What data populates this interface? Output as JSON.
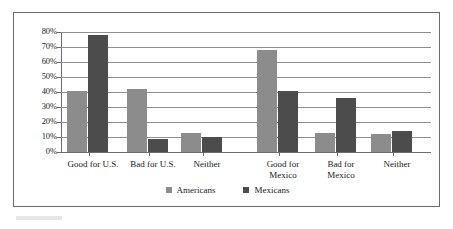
{
  "chart_data": {
    "type": "bar",
    "title": "",
    "xlabel": "",
    "ylabel": "",
    "ylim": [
      0,
      80
    ],
    "grid": true,
    "legend_position": "bottom-center",
    "categories": [
      "Good for U.S.",
      "Bad for U.S.",
      "Neither",
      "Good for\nMexico",
      "Bad for\nMexico",
      "Neither"
    ],
    "series": [
      {
        "name": "Americans",
        "color": "#8c8c8c",
        "values": [
          41,
          42,
          13,
          68,
          13,
          12
        ]
      },
      {
        "name": "Mexicans",
        "color": "#4c4c4c",
        "values": [
          78,
          9,
          10,
          41,
          36,
          14
        ]
      }
    ],
    "ytick_labels": [
      "80%",
      "70%",
      "60%",
      "50%",
      "40%",
      "30%",
      "20%",
      "10%",
      "0%"
    ],
    "ytick_values": [
      80,
      70,
      60,
      50,
      40,
      30,
      20,
      10,
      0
    ]
  },
  "legend": {
    "entries": [
      {
        "label": "Americans",
        "color": "#8c8c8c"
      },
      {
        "label": "Mexicans",
        "color": "#4c4c4c"
      }
    ]
  }
}
